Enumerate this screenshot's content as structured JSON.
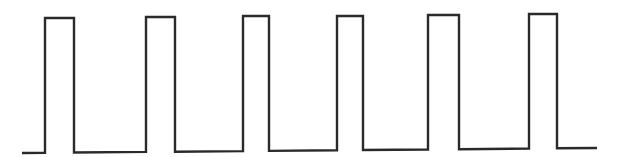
{
  "diagram": {
    "type": "pulse-train",
    "description": "Square / rectangular pulse waveform with six pulses",
    "stroke_color": "#2a2a2a",
    "background_color": "#ffffff",
    "stroke_width": 2.4,
    "baseline": {
      "x_start": 22,
      "x_end": 597,
      "y_start": 153,
      "y_end": 148
    },
    "pulses": [
      {
        "index": 1,
        "rise_x": 45,
        "fall_x": 74,
        "top_y": 18
      },
      {
        "index": 2,
        "rise_x": 146,
        "fall_x": 175,
        "top_y": 17
      },
      {
        "index": 3,
        "rise_x": 243,
        "fall_x": 269,
        "top_y": 16
      },
      {
        "index": 4,
        "rise_x": 337,
        "fall_x": 363,
        "top_y": 16
      },
      {
        "index": 5,
        "rise_x": 428,
        "fall_x": 459,
        "top_y": 15
      },
      {
        "index": 6,
        "rise_x": 529,
        "fall_x": 557,
        "top_y": 14
      }
    ],
    "pulse_count": 6
  }
}
